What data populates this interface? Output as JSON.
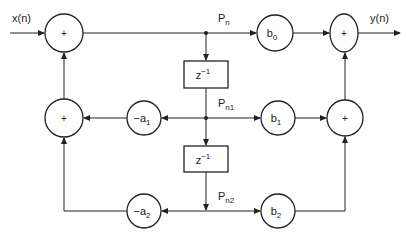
{
  "diagram": {
    "input_label": "x(n)",
    "output_label": "y(n)",
    "adder_symbol": "+",
    "delay_label": {
      "base": "z",
      "exp": "−1"
    },
    "node_labels": [
      {
        "base": "P",
        "sub": "n"
      },
      {
        "base": "P",
        "sub": "n1"
      },
      {
        "base": "P",
        "sub": "n2"
      }
    ],
    "feedforward_gains": [
      {
        "base": "b",
        "sub": "0"
      },
      {
        "base": "b",
        "sub": "1"
      },
      {
        "base": "b",
        "sub": "2"
      }
    ],
    "feedback_gains": [
      {
        "base": "−a",
        "sub": "1"
      },
      {
        "base": "−a",
        "sub": "2"
      }
    ]
  }
}
